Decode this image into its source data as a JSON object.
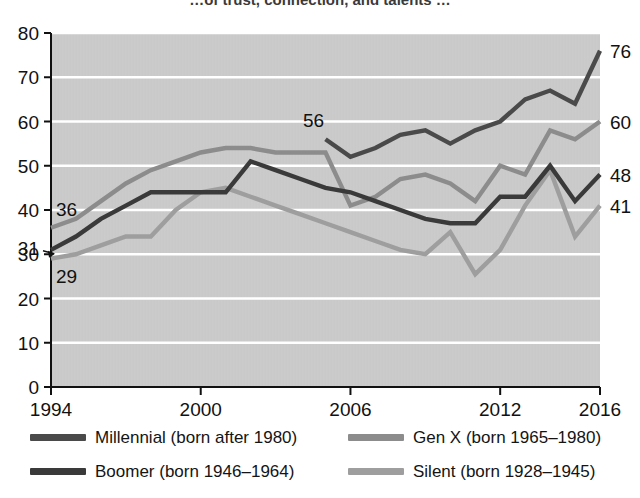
{
  "header": {
    "clipped_title": "…of trust, connection, and talents …"
  },
  "chart_data": {
    "type": "line",
    "title": "",
    "xlabel": "",
    "ylabel": "",
    "xlim": [
      1994,
      2016
    ],
    "ylim": [
      0,
      80
    ],
    "xticks": [
      1994,
      2000,
      2006,
      2012,
      2016
    ],
    "yticks": [
      0,
      10,
      20,
      30,
      40,
      50,
      60,
      70,
      80
    ],
    "grid": "horizontal",
    "plot_background": "#c9c9c9",
    "gridline_color": "#ffffff",
    "legend_position": "below",
    "x": [
      1994,
      1995,
      1996,
      1997,
      1998,
      1999,
      2000,
      2001,
      2002,
      2003,
      2004,
      2005,
      2006,
      2007,
      2008,
      2009,
      2010,
      2011,
      2012,
      2013,
      2014,
      2015,
      2016
    ],
    "series": [
      {
        "name": "Millennial (born after 1980)",
        "key": "millennial",
        "color": "#4a4a4a",
        "start_year": 2005,
        "start_label": "56",
        "end_label": "76",
        "x": [
          2005,
          2006,
          2007,
          2008,
          2009,
          2010,
          2011,
          2012,
          2013,
          2014,
          2015,
          2016
        ],
        "values": [
          56,
          52,
          54,
          57,
          58,
          55,
          58,
          60,
          65,
          67,
          64,
          76
        ]
      },
      {
        "name": "Gen X (born 1965–1980)",
        "key": "genx",
        "color": "#8c8c8c",
        "start_label": "36",
        "end_label": "60",
        "x": [
          1994,
          1995,
          1996,
          1997,
          1998,
          1999,
          2000,
          2001,
          2002,
          2003,
          2004,
          2005,
          2006,
          2007,
          2008,
          2009,
          2010,
          2011,
          2012,
          2013,
          2014,
          2015,
          2016
        ],
        "values": [
          36,
          38,
          42,
          46,
          49,
          51,
          53,
          54,
          54,
          53,
          53,
          53,
          41,
          43,
          47,
          48,
          46,
          42,
          50,
          48,
          58,
          56,
          60
        ]
      },
      {
        "name": "Boomer (born 1946–1964)",
        "key": "boomer",
        "color": "#3a3a3a",
        "start_label": "31",
        "end_label": "48",
        "x": [
          1994,
          1995,
          1996,
          1997,
          1998,
          1999,
          2000,
          2001,
          2002,
          2003,
          2004,
          2005,
          2006,
          2007,
          2008,
          2009,
          2010,
          2011,
          2012,
          2013,
          2014,
          2015,
          2016
        ],
        "values": [
          31,
          34,
          38,
          41,
          44,
          44,
          44,
          44,
          51,
          49,
          47,
          45,
          44,
          42,
          40,
          38,
          37,
          37,
          43,
          43,
          50,
          42,
          48
        ]
      },
      {
        "name": "Silent (born 1928–1945)",
        "key": "silent",
        "color": "#9e9e9e",
        "start_label": "29",
        "end_label": "41",
        "x": [
          1994,
          1995,
          1996,
          1997,
          1998,
          1999,
          2000,
          2001,
          2002,
          2003,
          2004,
          2005,
          2006,
          2007,
          2008,
          2009,
          2010,
          2011,
          2012,
          2013,
          2014,
          2015,
          2016
        ],
        "values": [
          29,
          30,
          32,
          34,
          34,
          40,
          44,
          45,
          43,
          41,
          39,
          37,
          35,
          33,
          31,
          30,
          35,
          25.5,
          31,
          41,
          49,
          34,
          41
        ]
      }
    ],
    "annotations": [
      {
        "text": "36",
        "series": "genx",
        "year": 1994,
        "value": 36,
        "side": "left"
      },
      {
        "text": "31",
        "series": "boomer",
        "year": 1994,
        "value": 31,
        "side": "left"
      },
      {
        "text": "29",
        "series": "silent",
        "year": 1994,
        "value": 29,
        "side": "left"
      },
      {
        "text": "56",
        "series": "millennial",
        "year": 2005,
        "value": 56,
        "side": "above"
      },
      {
        "text": "76",
        "series": "millennial",
        "year": 2016,
        "value": 76,
        "side": "right"
      },
      {
        "text": "60",
        "series": "genx",
        "year": 2016,
        "value": 60,
        "side": "right"
      },
      {
        "text": "48",
        "series": "boomer",
        "year": 2016,
        "value": 48,
        "side": "right"
      },
      {
        "text": "41",
        "series": "silent",
        "year": 2016,
        "value": 41,
        "side": "right"
      }
    ]
  },
  "legend": {
    "items": [
      {
        "label": "Millennial (born after 1980)",
        "color": "#4a4a4a"
      },
      {
        "label": "Gen X (born 1965–1980)",
        "color": "#8c8c8c"
      },
      {
        "label": "Boomer (born 1946–1964)",
        "color": "#3a3a3a"
      },
      {
        "label": "Silent (born 1928–1945)",
        "color": "#9e9e9e"
      }
    ]
  }
}
